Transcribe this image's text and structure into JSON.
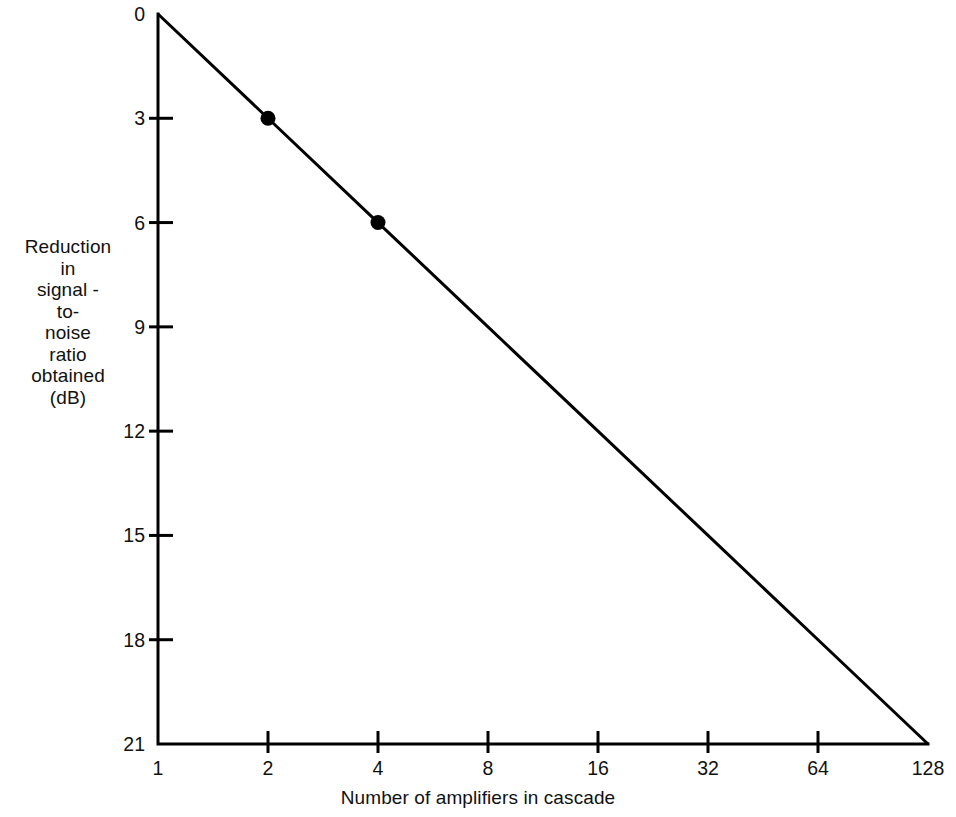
{
  "chart_data": {
    "type": "line",
    "title": "",
    "subtitle": "",
    "xlabel": "Number of amplifiers in cascade",
    "ylabel": "Reduction in signal - to- noise ratio obtained (dB)",
    "ylabel_lines": [
      "Reduction",
      "in",
      "signal -",
      "to-",
      "noise",
      "ratio",
      "obtained",
      "(dB)"
    ],
    "x_scale": "log2",
    "x_tick_labels": [
      "1",
      "2",
      "4",
      "8",
      "16",
      "32",
      "64",
      "128"
    ],
    "x_tick_values": [
      1,
      2,
      4,
      8,
      16,
      32,
      64,
      128
    ],
    "y_tick_labels": [
      "0",
      "3",
      "6",
      "9",
      "12",
      "15",
      "18",
      "21"
    ],
    "y_tick_values": [
      0,
      3,
      6,
      9,
      12,
      15,
      18,
      21
    ],
    "ylim": [
      0,
      21
    ],
    "y_axis_inverted": true,
    "grid": false,
    "legend": false,
    "series": [
      {
        "name": "Reduction in signal-to-noise ratio",
        "x": [
          1,
          2,
          4,
          8,
          16,
          32,
          64,
          128
        ],
        "values": [
          0,
          3,
          6,
          9,
          12,
          15,
          18,
          21
        ],
        "line_color": "#000000",
        "line_width": 3,
        "marker": "filled-circle",
        "marker_points": [
          {
            "x": 2,
            "y": 3
          },
          {
            "x": 4,
            "y": 6
          }
        ]
      }
    ],
    "axis_color": "#000000",
    "background_color": "#ffffff",
    "note": "3 dB loss per doubling of amplifiers in cascade"
  }
}
